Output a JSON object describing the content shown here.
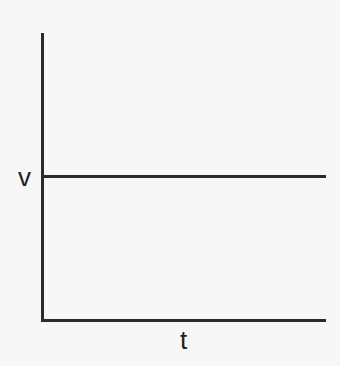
{
  "chart_data": {
    "type": "line",
    "title": "",
    "xlabel": "t",
    "ylabel": "",
    "series": [
      {
        "name": "v",
        "x": [
          0,
          1
        ],
        "values": [
          1,
          1
        ]
      }
    ],
    "annotations": [
      "v"
    ],
    "grid": false,
    "legend": "none"
  },
  "labels": {
    "y_level": "v",
    "x_axis": "t"
  }
}
